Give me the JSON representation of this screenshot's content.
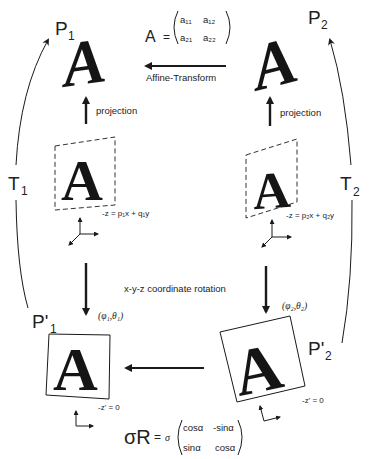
{
  "nodes": {
    "p1": {
      "label": "P",
      "sub": "1",
      "glyph": "A"
    },
    "p2": {
      "label": "P",
      "sub": "2",
      "glyph": "A"
    },
    "p1_prime": {
      "label": "P'",
      "sub": "1",
      "glyph": "A"
    },
    "p2_prime": {
      "label": "P'",
      "sub": "2",
      "glyph": "A"
    },
    "plane1": {
      "glyph": "A",
      "equation": "-z = p₁x + q₁y"
    },
    "plane2": {
      "glyph": "A",
      "equation": "-z = p₂x + q₂y"
    }
  },
  "edges": {
    "affine": {
      "label": "Affine-Transform"
    },
    "projection_left": {
      "label": "projection"
    },
    "projection_right": {
      "label": "projection"
    },
    "rotation": {
      "label": "x-y-z coordinate rotation"
    },
    "angles_left": {
      "label": "(φ₁,θ₁)"
    },
    "angles_right": {
      "label": "(φ₂,θ₂)"
    },
    "t1": {
      "label": "T",
      "sub": "1"
    },
    "t2": {
      "label": "T",
      "sub": "2"
    },
    "z_prime_left": {
      "label": "-z' = 0"
    },
    "z_prime_right": {
      "label": "-z' = 0"
    }
  },
  "matrix_a": {
    "name": "A",
    "eq": "=",
    "cells": [
      [
        "a₁₁",
        "a₁₂"
      ],
      [
        "a₂₁",
        "a₂₂"
      ]
    ]
  },
  "matrix_sr": {
    "name": "σR",
    "eq": "=",
    "scalar": "σ",
    "cells": [
      [
        "cosα",
        "-sinα"
      ],
      [
        "sinα",
        "cosα"
      ]
    ]
  },
  "colors": {
    "ink": "#1a1a1a",
    "background": "#ffffff"
  }
}
